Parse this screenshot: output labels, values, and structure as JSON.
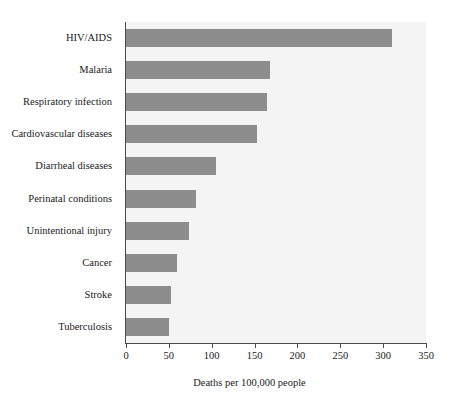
{
  "chart_data": {
    "type": "bar",
    "orientation": "horizontal",
    "title": "",
    "xlabel": "Deaths per 100,000 people",
    "ylabel": "",
    "xlim": [
      0,
      350
    ],
    "xticks": [
      0,
      50,
      100,
      150,
      200,
      250,
      300,
      350
    ],
    "xtick_labels": [
      "0",
      "50",
      "100",
      "150",
      "200",
      "250",
      "300",
      "350"
    ],
    "grid": false,
    "legend": false,
    "bar_color": "#8d8d8d",
    "plot_background": "#f4f4f4",
    "axis_color": "#4a4a4a",
    "categories": [
      "HIV/AIDS",
      "Malaria",
      "Respiratory infection",
      "Cardiovascular diseases",
      "Diarrheal diseases",
      "Perinatal conditions",
      "Unintentional injury",
      "Cancer",
      "Stroke",
      "Tuberculosis"
    ],
    "values": [
      310,
      168,
      165,
      153,
      105,
      82,
      73,
      60,
      52,
      50
    ],
    "bars": [
      {
        "label": "HIV/AIDS",
        "value": 310
      },
      {
        "label": "Malaria",
        "value": 168
      },
      {
        "label": "Respiratory infection",
        "value": 165
      },
      {
        "label": "Cardiovascular diseases",
        "value": 153
      },
      {
        "label": "Diarrheal diseases",
        "value": 105
      },
      {
        "label": "Perinatal conditions",
        "value": 82
      },
      {
        "label": "Unintentional injury",
        "value": 73
      },
      {
        "label": "Cancer",
        "value": 60
      },
      {
        "label": "Stroke",
        "value": 52
      },
      {
        "label": "Tuberculosis",
        "value": 50
      }
    ]
  }
}
